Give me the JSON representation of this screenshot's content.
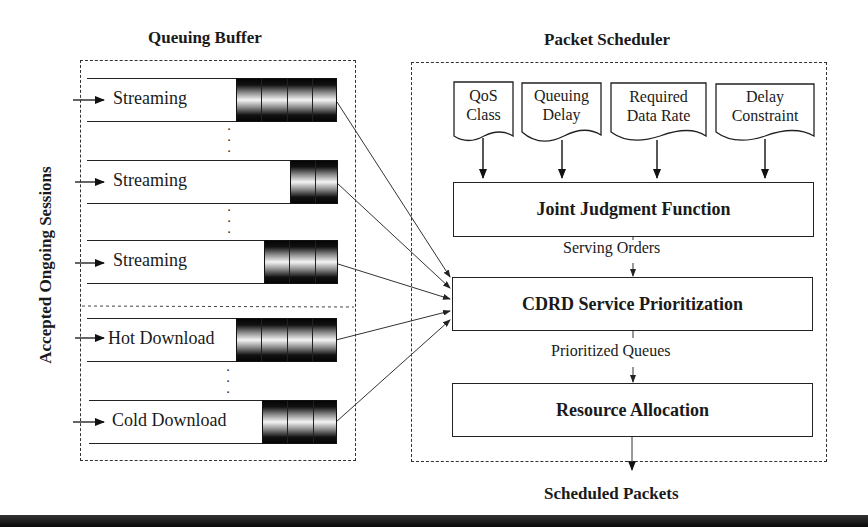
{
  "queuing_buffer": {
    "title": "Queuing Buffer",
    "side_label": "Accepted Ongoing Sessions",
    "queues": [
      {
        "label": "Streaming",
        "cells": 4
      },
      {
        "label": "Streaming",
        "cells": 2
      },
      {
        "label": "Streaming",
        "cells": 3
      },
      {
        "label": "Hot Download",
        "cells": 4
      },
      {
        "label": "Cold Download",
        "cells": 3
      }
    ],
    "ellipsis": "⋮"
  },
  "packet_scheduler": {
    "title": "Packet Scheduler",
    "inputs": [
      {
        "line1": "QoS",
        "line2": "Class"
      },
      {
        "line1": "Queuing",
        "line2": "Delay"
      },
      {
        "line1": "Required",
        "line2": "Data Rate"
      },
      {
        "line1": "Delay",
        "line2": "Constraint"
      }
    ],
    "joint_judgment": "Joint Judgment Function",
    "serving_orders": "Serving Orders",
    "cdrd": "CDRD Service Prioritization",
    "prioritized_queues": "Prioritized Queues",
    "resource_allocation": "Resource Allocation"
  },
  "output_label": "Scheduled Packets"
}
